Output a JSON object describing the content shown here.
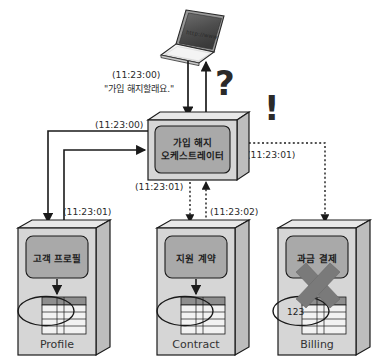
{
  "diagram": {
    "client": {
      "name": "laptop",
      "screen_text": "http://www"
    },
    "orchestrator": {
      "label_line1": "가입 해지",
      "label_line2": "오케스트레이터"
    },
    "marks": {
      "question": "?",
      "exclamation": "!"
    },
    "messages": {
      "request_time": "(11:23:00)",
      "request_text": "\"가입 해지할래요.\"",
      "profile_call_time": "(11:23:00)",
      "profile_reply_time": "(11:23:01)",
      "orchestrator_right_time": "(11:23:01)",
      "contract_call_time": "(11:23:01)",
      "contract_reply_time": "(11:23:02)"
    },
    "services": [
      {
        "id": "profile",
        "panel_label": "고객 프로필",
        "db_label": "Profile",
        "ellipse_text": "",
        "failed": false
      },
      {
        "id": "contract",
        "panel_label": "지원 계약",
        "db_label": "Contract",
        "ellipse_text": "",
        "failed": false
      },
      {
        "id": "billing",
        "panel_label": "과금 결제",
        "db_label": "Billing",
        "ellipse_text": "123",
        "failed": true
      }
    ],
    "colors": {
      "box_front": "#d6d6d6",
      "box_top": "#e8e8e8",
      "box_side": "#bdbdbd",
      "panel": "#a9a9a9",
      "stroke": "#1a1a1a",
      "mark": "#6e6e6e",
      "x_mark": "#7a7a7a",
      "table_header": "#8e8e8e",
      "table_body": "#f2f2f2"
    }
  }
}
